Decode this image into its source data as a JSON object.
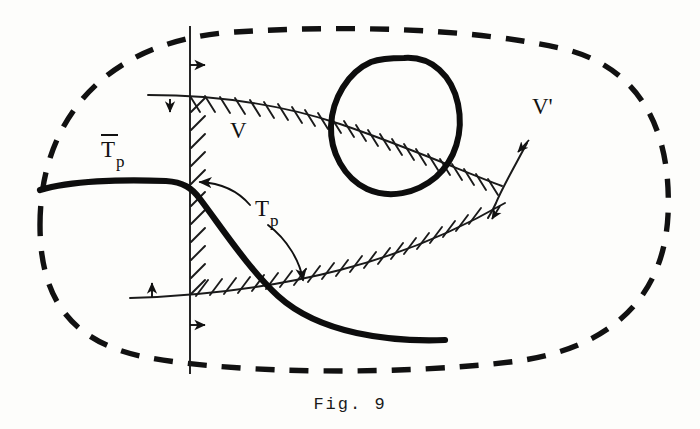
{
  "figure": {
    "caption": "Fig. 9",
    "domain_label": "",
    "labels": {
      "t_bar_p_base": "T",
      "t_bar_p_sub": "p",
      "t_p_base": "T",
      "t_p_sub": "p",
      "region_v": "V",
      "region_v_prime": "V'"
    },
    "icons": {
      "overbar": "macron-overbar",
      "arrow_up": "arrow-up-icon",
      "arrow_down": "arrow-down-icon",
      "arrow_right": "arrow-right-icon",
      "curved_arrow_left": "curved-arrow-left-icon",
      "curved_arrow_down": "curved-arrow-down-icon",
      "hatching": "hatching-ticks"
    },
    "colors": {
      "ink": "#111111",
      "paper": "#fdfdfb",
      "thin_line": "#1a1a1a",
      "thick_line": "#0d0d0d"
    },
    "elements": {
      "outer_boundary": "dashed-rounded-region",
      "vertical_line": "vertical-axis-line",
      "upper_boundary": "upper-hatched-curve",
      "lower_boundary": "lower-hatched-curve",
      "closed_loop": "thick-closed-oval",
      "thick_curve": "thick-transversal-curve",
      "v_prime_line": "v-prime-tangent-line"
    },
    "arrow_markers": [
      {
        "name": "arrow-right-upper-axis",
        "direction": "right",
        "x": 196,
        "y": 65
      },
      {
        "name": "arrow-down-upper-curve",
        "direction": "down",
        "x": 176,
        "y": 107
      },
      {
        "name": "arrow-up-lower-curve",
        "direction": "up",
        "x": 152,
        "y": 288
      },
      {
        "name": "arrow-right-lower-axis",
        "direction": "right",
        "x": 196,
        "y": 325
      },
      {
        "name": "arrow-up-left-v-prime",
        "direction": "up-left",
        "x": 522,
        "y": 146
      },
      {
        "name": "arrow-down-left-v-prime",
        "direction": "down-left",
        "x": 508,
        "y": 212
      }
    ]
  }
}
